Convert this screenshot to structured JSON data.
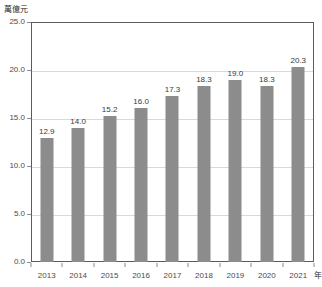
{
  "chart_data": {
    "type": "bar",
    "title": "",
    "subtitle": "",
    "xlabel": "年",
    "ylabel": "萬億元",
    "categories": [
      "2013",
      "2014",
      "2015",
      "2016",
      "2017",
      "2018",
      "2019",
      "2020",
      "2021"
    ],
    "values": [
      12.9,
      14.0,
      15.2,
      16.0,
      17.3,
      18.3,
      19.0,
      18.3,
      20.3
    ],
    "value_labels": [
      "12.9",
      "14.0",
      "15.2",
      "16.0",
      "17.3",
      "18.3",
      "19.0",
      "18.3",
      "20.3"
    ],
    "ylim": [
      0.0,
      25.0
    ],
    "yticks": [
      0.0,
      5.0,
      10.0,
      15.0,
      20.0,
      25.0
    ],
    "ytick_labels": [
      "0.0",
      "5.0",
      "10.0",
      "15.0",
      "20.0",
      "25.0"
    ],
    "grid": true,
    "grid_axis": "y",
    "legend": false,
    "legend_position": "none",
    "series": [
      {
        "name": "",
        "values": [
          12.9,
          14.0,
          15.2,
          16.0,
          17.3,
          18.3,
          19.0,
          18.3,
          20.3
        ],
        "color": "#8c8c8c"
      }
    ],
    "colors": {
      "bar": "#8c8c8c",
      "frame": "#5c5c5c",
      "gridline": "#d9d9d9",
      "tick_text": "#4a4a4a",
      "value_text": "#3a3a3a",
      "unit_text": "#2b2b2b",
      "background": "#ffffff"
    }
  }
}
